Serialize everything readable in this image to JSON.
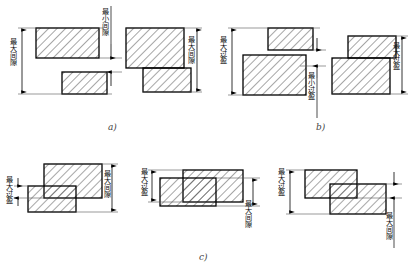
{
  "figure": {
    "title_visible": false,
    "background": "#ffffff",
    "line_color": "#000000",
    "hatch_color": "#333333",
    "extension_line_color": "#555555",
    "captions": [
      {
        "id": "a",
        "text": "a)",
        "x": 108,
        "y": 122
      },
      {
        "id": "b",
        "text": "b)",
        "x": 316,
        "y": 122
      },
      {
        "id": "c",
        "text": "c)",
        "x": 199,
        "y": 252
      }
    ],
    "labels": {
      "max_clearance": "最大间隙",
      "min_clearance": "最小间隙",
      "max_interference": "最大过盈",
      "min_interference": "最小过盈"
    },
    "groups": [
      {
        "id": "a-left",
        "fit_type": "clearance",
        "hole": {
          "x": 36,
          "y": 28,
          "w": 63,
          "h": 30
        },
        "shaft": {
          "x": 62,
          "y": 72,
          "w": 45,
          "h": 22
        },
        "dimension": {
          "label": "最大间隙",
          "side": "left",
          "x": 22,
          "y1": 28,
          "y2": 94
        }
      },
      {
        "id": "a-mid",
        "fit_type": "clearance",
        "dimension": {
          "label": "最小间隙",
          "side": "right",
          "x": 110,
          "y1": 58,
          "y2": 72
        }
      },
      {
        "id": "a-right",
        "fit_type": "clearance",
        "hole": {
          "x": 126,
          "y": 28,
          "w": 58,
          "h": 40
        },
        "shaft": {
          "x": 143,
          "y": 68,
          "w": 48,
          "h": 24
        },
        "dimension": {
          "label": "最大间隙",
          "side": "right",
          "x": 197,
          "y1": 28,
          "y2": 92
        }
      },
      {
        "id": "b-left",
        "fit_type": "interference",
        "hole": {
          "x": 268,
          "y": 28,
          "w": 45,
          "h": 22
        },
        "shaft": {
          "x": 243,
          "y": 55,
          "w": 63,
          "h": 40
        },
        "dimension": {
          "label": "最大过盈",
          "side": "left",
          "x": 232,
          "y1": 28,
          "y2": 95
        }
      },
      {
        "id": "b-mid",
        "fit_type": "interference",
        "dimension": {
          "label": "最小过盈",
          "side": "right",
          "x": 316,
          "y1": 50,
          "y2": 66
        }
      },
      {
        "id": "b-right",
        "fit_type": "interference",
        "hole": {
          "x": 348,
          "y": 36,
          "w": 48,
          "h": 22
        },
        "shaft": {
          "x": 332,
          "y": 58,
          "w": 58,
          "h": 36
        },
        "dimension": {
          "label": "最大过盈",
          "side": "right",
          "x": 402,
          "y1": 36,
          "y2": 94
        }
      },
      {
        "id": "c-left",
        "fit_type": "transition",
        "hole": {
          "x": 44,
          "y": 164,
          "w": 58,
          "h": 34
        },
        "shaft": {
          "x": 28,
          "y": 186,
          "w": 48,
          "h": 26
        },
        "dimension_a": {
          "label": "最大过盈",
          "side": "left",
          "x": 18,
          "y1": 186,
          "y2": 198
        },
        "dimension_b": {
          "label": "最大间隙",
          "side": "right",
          "x": 112,
          "y1": 164,
          "y2": 212
        }
      },
      {
        "id": "c-mid",
        "fit_type": "transition",
        "hole": {
          "x": 183,
          "y": 170,
          "w": 60,
          "h": 32
        },
        "shaft": {
          "x": 160,
          "y": 178,
          "w": 56,
          "h": 28
        },
        "dimension_a": {
          "label": "最大过盈",
          "side": "left",
          "x": 152,
          "y1": 170,
          "y2": 202
        },
        "dimension_b": {
          "label": "最大间隙",
          "side": "right",
          "x": 253,
          "y1": 178,
          "y2": 206
        }
      },
      {
        "id": "c-right",
        "fit_type": "transition",
        "hole": {
          "x": 305,
          "y": 170,
          "w": 52,
          "h": 28
        },
        "shaft": {
          "x": 330,
          "y": 184,
          "w": 56,
          "h": 30
        },
        "dimension_a": {
          "label": "最大过盈",
          "side": "left",
          "x": 290,
          "y1": 170,
          "y2": 214
        },
        "dimension_b": {
          "label": "最大间隙",
          "side": "right",
          "x": 394,
          "y1": 184,
          "y2": 198
        }
      }
    ]
  }
}
